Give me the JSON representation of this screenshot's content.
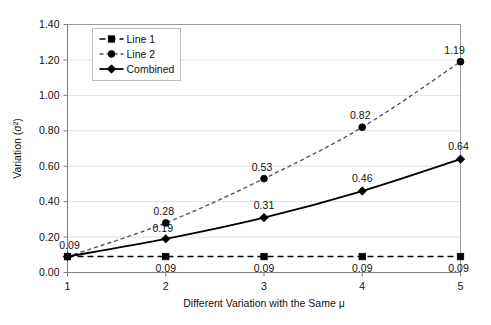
{
  "chart_data": {
    "type": "line",
    "title": "",
    "xlabel": "Different Variation with the Same μ",
    "ylabel": "Variation (σ²)",
    "x": [
      1,
      2,
      3,
      4,
      5
    ],
    "xticklabels": [
      "1",
      "2",
      "3",
      "4",
      "5"
    ],
    "yticklabels": [
      "0.00",
      "0.20",
      "0.40",
      "0.60",
      "0.80",
      "1.00",
      "1.20",
      "1.40"
    ],
    "yticks": [
      0.0,
      0.2,
      0.4,
      0.6,
      0.8,
      1.0,
      1.2,
      1.4
    ],
    "xlim": [
      1,
      5
    ],
    "ylim": [
      0.0,
      1.4
    ],
    "grid": "horizontal",
    "legend_position": "top-left-inside",
    "series": [
      {
        "name": "Line 1",
        "marker": "square",
        "linestyle": "dashed",
        "color": "#000000",
        "values": [
          0.09,
          0.09,
          0.09,
          0.09,
          0.09
        ],
        "labels": [
          "0.09",
          "0.09",
          "0.09",
          "0.09",
          "0.09"
        ]
      },
      {
        "name": "Line 2",
        "marker": "circle",
        "linestyle": "dashed",
        "color": "#555555",
        "values": [
          0.09,
          0.28,
          0.53,
          0.82,
          1.19
        ],
        "labels": [
          "0.09",
          "0.28",
          "0.53",
          "0.82",
          "1.19"
        ]
      },
      {
        "name": "Combined",
        "marker": "diamond",
        "linestyle": "solid",
        "color": "#000000",
        "values": [
          0.09,
          0.19,
          0.31,
          0.46,
          0.64
        ],
        "labels": [
          "0.09",
          "0.19",
          "0.31",
          "0.46",
          "0.64"
        ]
      }
    ]
  },
  "legend": {
    "entries": [
      {
        "label": "Line 1"
      },
      {
        "label": "Line 2"
      },
      {
        "label": "Combined"
      }
    ]
  },
  "axes": {
    "x_title": "Different Variation with the Same μ",
    "y_title": "Variation (σ²)"
  }
}
